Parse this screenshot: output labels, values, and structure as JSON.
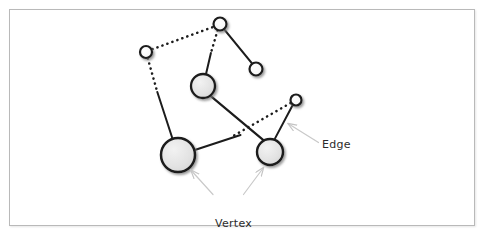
{
  "figure": {
    "title": "",
    "background_color": "#ffffff",
    "frame_color": "#b9b9b9"
  },
  "labels": {
    "edge": "Edge",
    "vertex_line1": "Vertex",
    "vertex_line2": "or node"
  },
  "chart_data": {
    "type": "diagram",
    "subtype": "node-link-graph",
    "title": "",
    "xlabel": "",
    "ylabel": "",
    "colors": {
      "node_fill": "#e3e3e3",
      "node_stroke": "#1a1a1a",
      "edge_solid": "#1a1a1a",
      "edge_dotted": "#1a1a1a",
      "leader_line": "#c9c9c9",
      "text": "#2b2b2b"
    },
    "nodes": [
      {
        "id": "n1",
        "label": "",
        "x": 146,
        "y": 52,
        "r": 6.0,
        "size": "small",
        "fill": "#f4f4f4"
      },
      {
        "id": "n2",
        "label": "",
        "x": 220,
        "y": 24,
        "r": 6.5,
        "size": "small",
        "fill": "#f4f4f4"
      },
      {
        "id": "n3",
        "label": "",
        "x": 256,
        "y": 69,
        "r": 6.5,
        "size": "small",
        "fill": "#f7f7f7"
      },
      {
        "id": "n4",
        "label": "",
        "x": 203,
        "y": 86,
        "r": 12.0,
        "size": "medium",
        "fill": "#e0e0e0"
      },
      {
        "id": "n5",
        "label": "",
        "x": 178,
        "y": 155,
        "r": 17.0,
        "size": "large",
        "fill": "#e3e3e3"
      },
      {
        "id": "n6",
        "label": "",
        "x": 270,
        "y": 152,
        "r": 13.0,
        "size": "medium",
        "fill": "#e0e0e0"
      },
      {
        "id": "n7",
        "label": "",
        "x": 296,
        "y": 100,
        "r": 5.5,
        "size": "small",
        "fill": "#f4f4f4"
      }
    ],
    "edges": [
      {
        "from": "n1",
        "to": "n2",
        "style": "dotted"
      },
      {
        "from": "n2",
        "to": "n3",
        "style": "solid"
      },
      {
        "from": "n2",
        "to": "n4",
        "style": "dotted"
      },
      {
        "from": "n1",
        "to": "n5",
        "style": "dotted-then-solid"
      },
      {
        "from": "n4",
        "to": "n6",
        "style": "solid"
      },
      {
        "from": "n5",
        "to": "n6",
        "style": "solid-then-dotted"
      },
      {
        "from": "n6",
        "to": "n7",
        "style": "solid"
      },
      {
        "from": "n7",
        "to": "n5",
        "style": "dotted"
      }
    ],
    "annotations": [
      {
        "text": "Edge",
        "x": 322,
        "y": 145,
        "points_to": [
          285,
          122
        ]
      },
      {
        "text": "Vertex",
        "x": 215,
        "y": 199,
        "points_to": [
          188,
          168
        ]
      },
      {
        "text": "or node",
        "x": 215,
        "y": 212,
        "points_to": [
          263,
          167
        ]
      }
    ]
  }
}
